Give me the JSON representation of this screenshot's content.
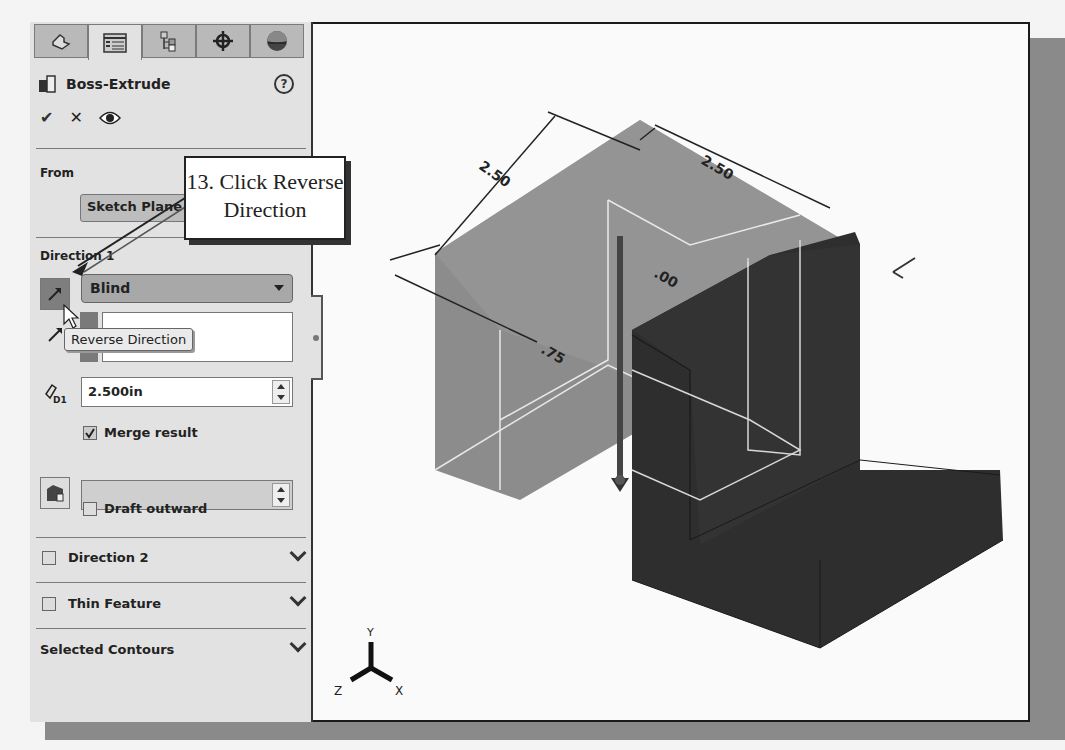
{
  "property_manager": {
    "tabs": [
      {
        "name": "feature-manager",
        "icon": "part-icon"
      },
      {
        "name": "property-manager",
        "icon": "property-list-icon",
        "active": true
      },
      {
        "name": "configuration-manager",
        "icon": "configuration-icon"
      },
      {
        "name": "dimxpert-manager",
        "icon": "crosshair-icon"
      },
      {
        "name": "display-manager",
        "icon": "appearance-sphere-icon"
      }
    ],
    "title": "Boss-Extrude",
    "help": "?",
    "actions": {
      "ok": "✔",
      "cancel": "✕",
      "preview": "eye"
    },
    "from": {
      "label": "From",
      "value": "Sketch Plane"
    },
    "direction1": {
      "label": "Direction 1",
      "end_condition": "Blind",
      "depth": "2.500in",
      "depth_icon_label": "D1",
      "merge_result": {
        "label": "Merge result",
        "checked": true
      },
      "draft_outward": {
        "label": "Draft outward",
        "checked": false
      },
      "reverse_tooltip": "Reverse Direction"
    },
    "collapsed_sections": [
      {
        "label": "Direction 2",
        "has_checkbox": true
      },
      {
        "label": "Thin Feature",
        "has_checkbox": true
      },
      {
        "label": "Selected Contours",
        "has_checkbox": false
      }
    ]
  },
  "callout": {
    "line1": "13. Click Reverse",
    "line2": "Direction"
  },
  "viewport": {
    "dimensions": [
      "2.50",
      "2.50",
      ".75",
      ".00"
    ],
    "triad": {
      "x": "X",
      "y": "Y",
      "z": "Z"
    }
  },
  "colors": {
    "panel_bg": "#e2e2e2",
    "preview_gray": "#8c8c8c",
    "solid_dark": "#2e2e2e",
    "frame_shadow": "#8a8a8a"
  }
}
